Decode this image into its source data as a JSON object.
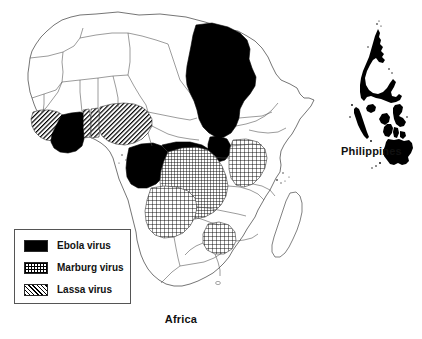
{
  "figure": {
    "title": "",
    "background_color": "#ffffff",
    "outline_color": "#555555",
    "fill_black": "#000000"
  },
  "legend": {
    "name": "virus-legend",
    "items": [
      {
        "label": "Ebola virus",
        "pattern": "solid-black",
        "swatch_icon": "solid-swatch-icon"
      },
      {
        "label": "Marburg virus",
        "pattern": "cross-hatch",
        "swatch_icon": "grid-swatch-icon"
      },
      {
        "label": "Lassa virus",
        "pattern": "diagonal-hatch",
        "swatch_icon": "diagonal-swatch-icon"
      }
    ]
  },
  "maps": [
    {
      "name": "africa-map",
      "caption": "Africa",
      "regions_ebola": [
        "Ivory Coast / Ghana",
        "Sudan",
        "Gabon",
        "Democratic Republic of the Congo (west)"
      ],
      "regions_marburg": [
        "Democratic Republic of the Congo",
        "Uganda",
        "Kenya",
        "Angola",
        "Zimbabwe"
      ],
      "regions_lassa": [
        "Guinea",
        "Sierra Leone",
        "Liberia",
        "Nigeria",
        "Benin",
        "Togo"
      ]
    },
    {
      "name": "philippines-map",
      "caption": "Philippines",
      "fill": "solid-black"
    }
  ],
  "captions": {
    "africa": "Africa",
    "philippines": "Philippines"
  }
}
